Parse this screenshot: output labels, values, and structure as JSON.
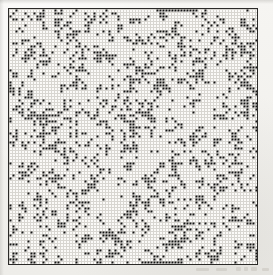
{
  "figure": {
    "canvas": {
      "width": 273,
      "height": 275
    },
    "paper_color": "#f2f1ee",
    "ink_color": "#111111",
    "gridline_color": "#d8d6d1",
    "cell_fill_color": "#141414",
    "border_color": "#2b2a28"
  },
  "lattice": {
    "frame": {
      "x": 8,
      "y": 8,
      "width": 250,
      "height": 257
    },
    "border_width_px": 1.5,
    "cell_pitch_px": 3,
    "cell_size_px": 2,
    "columns": 83,
    "rows": 85,
    "total_sites": 7055,
    "occupied_fraction": 0.165,
    "occupied_label": "p = 0.165",
    "empty_label": "empty site",
    "occupied_site_label": "occupied site"
  },
  "chart_data": {
    "type": "heatmap",
    "xlabel": "",
    "ylabel": "",
    "columns": 83,
    "rows": 85,
    "value_map": {
      "0": "empty",
      "1": "occupied"
    },
    "legend": [
      {
        "label": "empty site",
        "color": "#fbfaf8"
      },
      {
        "label": "occupied site",
        "color": "#141414"
      }
    ],
    "grid": true,
    "legend_position": "none",
    "occupied_fraction": 0.165,
    "seed": 20250417,
    "generation": "pseudo-random Bernoulli site occupancy with local clustering bias",
    "cluster_bias": 0.42,
    "special_features": [
      {
        "name": "top-edge-run",
        "row": 0,
        "col_start": 49,
        "col_end": 60,
        "note": "contiguous run of occupied sites along upper border"
      },
      {
        "name": "bottom-edge-run",
        "row": 84,
        "col_start": 46,
        "col_end": 57,
        "note": "contiguous run of occupied sites along lower border"
      }
    ]
  },
  "annotations": {
    "caption_smudges": [
      {
        "name": "caption-smudge-a"
      },
      {
        "name": "caption-smudge-b"
      },
      {
        "name": "caption-smudge-c"
      },
      {
        "name": "caption-smudge-d"
      },
      {
        "name": "caption-smudge-e"
      },
      {
        "name": "caption-smudge-f"
      }
    ]
  }
}
